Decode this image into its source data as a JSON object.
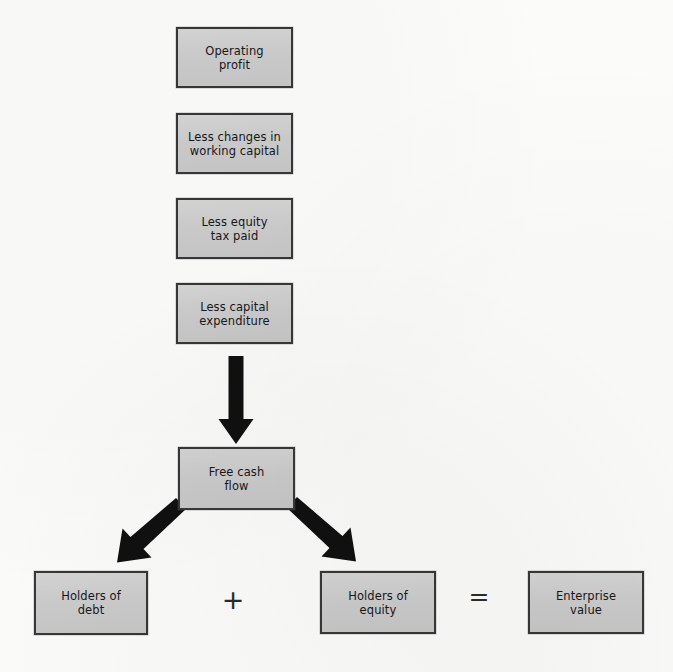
{
  "diagram": {
    "background_color": "#fbfbfa",
    "box_fill_color": "#cdcdcd",
    "box_border_color": "#373737",
    "arrow_color": "#111111",
    "text_color": "#17171a"
  },
  "nodes": {
    "operating_profit": {
      "label": "Operating\nprofit"
    },
    "working_capital": {
      "label": "Less changes in\nworking capital"
    },
    "equity_tax": {
      "label": "Less equity\ntax paid"
    },
    "capital_expenditure": {
      "label": "Less capital\nexpenditure"
    },
    "free_cash_flow": {
      "label": "Free cash\nflow"
    },
    "holders_of_debt": {
      "label": "Holders of\ndebt"
    },
    "holders_of_equity": {
      "label": "Holders of\nequity"
    },
    "enterprise_value": {
      "label": "Enterprise\nvalue"
    }
  },
  "operators": {
    "plus": "+",
    "equals": "="
  },
  "connectors": [
    {
      "name": "down-arrow-to-free-cash-flow",
      "from": "capital_expenditure",
      "to": "free_cash_flow",
      "style": "thick-solid-down"
    },
    {
      "name": "branch-arrow-to-holders-of-debt",
      "from": "free_cash_flow",
      "to": "holders_of_debt",
      "style": "thick-solid-diagonal-left"
    },
    {
      "name": "branch-arrow-to-holders-of-equity",
      "from": "free_cash_flow",
      "to": "holders_of_equity",
      "style": "thick-solid-diagonal-right"
    }
  ],
  "equation": {
    "expression": "Holders of debt + Holders of equity = Enterprise value"
  }
}
